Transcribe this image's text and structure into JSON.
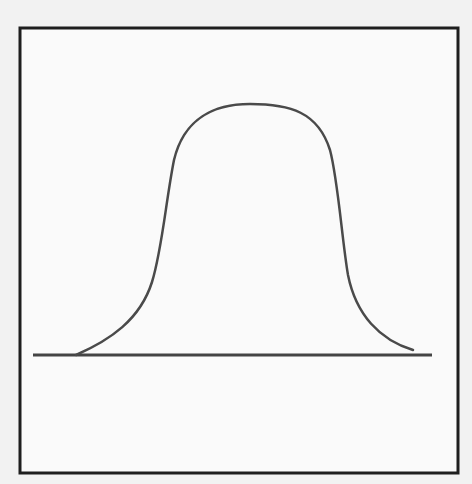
{
  "diagram": {
    "type": "bell-curve-sketch",
    "frame": {
      "x": 20,
      "y": 28,
      "width": 438,
      "height": 445,
      "stroke": "#1e1e1e"
    },
    "baseline": {
      "x1": 33,
      "x2": 432,
      "y": 355,
      "stroke": "#444444"
    },
    "curve": {
      "stroke": "#4a4a4a",
      "start": [
        76,
        355
      ],
      "peak": [
        250,
        104
      ],
      "end": [
        413,
        350
      ]
    },
    "background": "#f2f2f2",
    "inner_background": "#fafafa"
  }
}
